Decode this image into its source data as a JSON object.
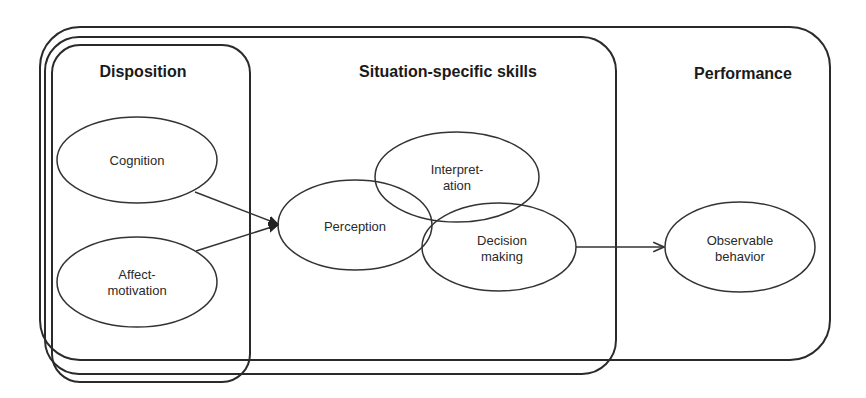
{
  "diagram": {
    "groups": [
      {
        "id": "performance",
        "title": "Performance"
      },
      {
        "id": "situation",
        "title": "Situation-specific skills"
      },
      {
        "id": "disposition",
        "title": "Disposition"
      }
    ],
    "nodes": {
      "cognition": {
        "lines": [
          "Cognition"
        ]
      },
      "affect": {
        "lines": [
          "Affect-",
          "motivation"
        ]
      },
      "perception": {
        "lines": [
          "Perception"
        ]
      },
      "interpretation": {
        "lines": [
          "Interpret-",
          "ation"
        ]
      },
      "decision": {
        "lines": [
          "Decision",
          "making"
        ]
      },
      "observable": {
        "lines": [
          "Observable",
          "behavior"
        ]
      }
    },
    "edges": [
      {
        "from": "Cognition",
        "to": "Perception"
      },
      {
        "from": "Affect-motivation",
        "to": "Perception"
      },
      {
        "from": "Decision making",
        "to": "Observable behavior"
      }
    ],
    "colors": {
      "stroke": "#2a2a2a",
      "background": "#ffffff",
      "text": "#222222"
    }
  }
}
